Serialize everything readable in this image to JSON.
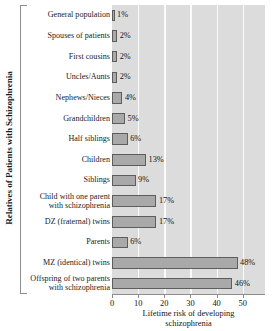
{
  "chart_data": {
    "type": "bar",
    "orientation": "horizontal",
    "title": "",
    "xlabel": "Lifetime risk of developing schizophrenia",
    "ylabel": "Relatives of Patients with Schizophrenia",
    "xlim": [
      0,
      58.5
    ],
    "xticks": [
      0,
      10,
      20,
      30,
      40,
      50
    ],
    "xtick_labels": [
      "0",
      "10",
      "20",
      "30",
      "40",
      "50"
    ],
    "grid": true,
    "gridlines_at": [
      10,
      20,
      30,
      40,
      50
    ],
    "legend": null,
    "value_suffix": "%",
    "categories": [
      "General population",
      "Spouses of patients",
      "First cousins",
      "Uncles/Aunts",
      "Nephews/Nieces",
      "Grandchildren",
      "Half siblings",
      "Children",
      "Siblings",
      "Child with one parent with schizophrenia",
      "DZ (fraternal) twins",
      "Parents",
      "MZ (identical) twins",
      "Offspring of two parents with schizophrenia"
    ],
    "values": [
      1,
      2,
      2,
      2,
      4,
      5,
      6,
      13,
      9,
      17,
      17,
      6,
      48,
      46
    ],
    "value_labels": [
      "1%",
      "2%",
      "2%",
      "2%",
      "4%",
      "5%",
      "6%",
      "13%",
      "9%",
      "17%",
      "17%",
      "6%",
      "48%",
      "46%"
    ]
  },
  "rows": [
    {
      "label_line1": "General population",
      "label_line2": "",
      "value_label": "1%"
    },
    {
      "label_line1": "Spouses of patients",
      "label_line2": "",
      "value_label": "2%"
    },
    {
      "label_line1": "First cousins",
      "label_line2": "",
      "value_label": "2%"
    },
    {
      "label_line1": "Uncles/Aunts",
      "label_line2": "",
      "value_label": "2%"
    },
    {
      "label_line1": "Nephews/Nieces",
      "label_line2": "",
      "value_label": "4%"
    },
    {
      "label_line1": "Grandchildren",
      "label_line2": "",
      "value_label": "5%"
    },
    {
      "label_line1": "Half siblings",
      "label_line2": "",
      "value_label": "6%"
    },
    {
      "label_line1": "Children",
      "label_line2": "",
      "value_label": "13%"
    },
    {
      "label_line1": "Siblings",
      "label_line2": "",
      "value_label": "9%"
    },
    {
      "label_line1": "Child with one parent",
      "label_line2": "with schizophrenia",
      "value_label": "17%"
    },
    {
      "label_line1": "DZ (fraternal) twins",
      "label_line2": "",
      "value_label": "17%"
    },
    {
      "label_line1": "Parents",
      "label_line2": "",
      "value_label": "6%"
    },
    {
      "label_line1": "MZ (identical) twins",
      "label_line2": "",
      "value_label": "48%"
    },
    {
      "label_line1": "Offspring of two parents",
      "label_line2": "with schizophrenia",
      "value_label": "46%"
    }
  ],
  "axes": {
    "y_title": "Relatives of Patients with Schizophrenia",
    "x_title_line1": "Lifetime risk of developing",
    "x_title_line2": "schizophrenia",
    "x_tick_labels": [
      "0",
      "10",
      "20",
      "30",
      "40",
      "50"
    ]
  },
  "colors": {
    "plot_background": "#dcdcdc",
    "gridline": "#fbfbfb",
    "bar_fill": "#a9a9a9",
    "bar_border": "#5d5d5d",
    "axis": "#8d8d8d",
    "text": "#141414"
  }
}
